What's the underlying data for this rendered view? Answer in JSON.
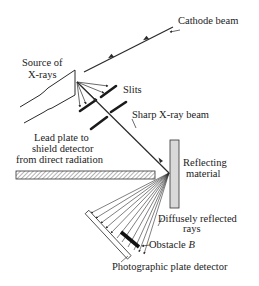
{
  "diagram": {
    "labels": {
      "cathode_beam": "Cathode beam",
      "source_line1": "Source of",
      "source_line2": "X-rays",
      "slits": "Slits",
      "sharp_beam": "Sharp X-ray beam",
      "lead_line1": "Lead plate to",
      "lead_line2": "shield detector",
      "lead_line3": "from direct radiation",
      "reflect_line1": "Reflecting",
      "reflect_line2": "material",
      "diffuse_line1": "Diffusely reflected",
      "diffuse_line2": "rays",
      "obstacle": "Obstacle",
      "obstacle_letter": "B",
      "detector": "Photographic plate detector"
    },
    "colors": {
      "line": "#2a2a2a",
      "text": "#222222",
      "reflector_fill": "#d9d9d9",
      "background": "#ffffff"
    }
  }
}
